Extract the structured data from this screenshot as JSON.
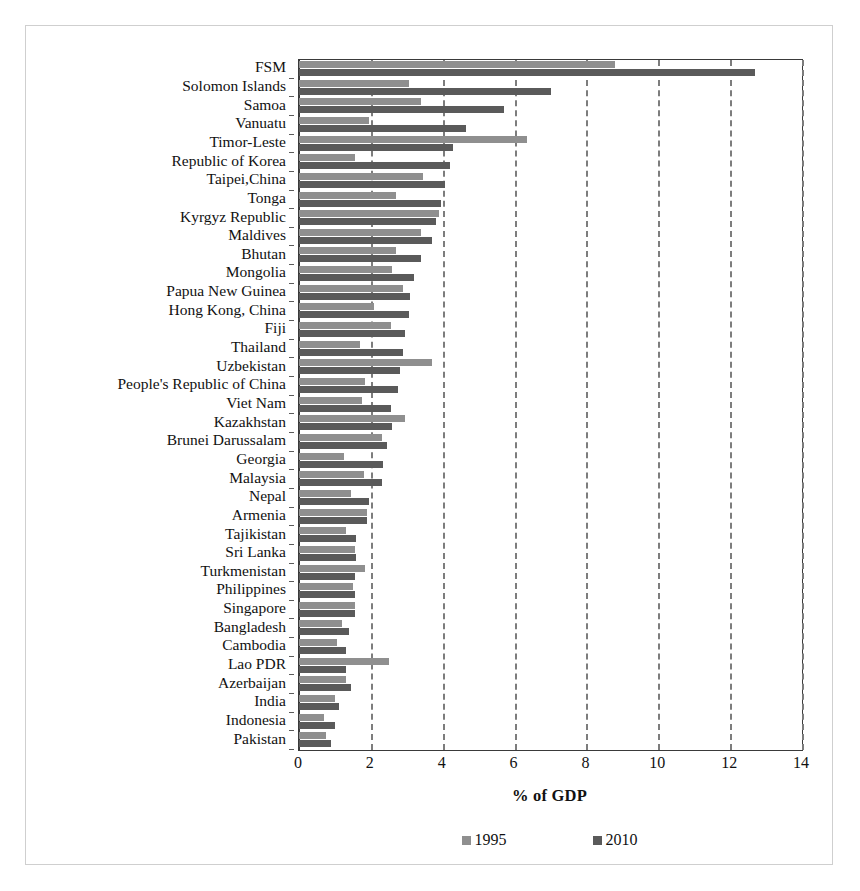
{
  "chart_data": {
    "type": "bar",
    "orientation": "horizontal",
    "title": "",
    "xlabel": "% of GDP",
    "ylabel": "",
    "xlim": [
      0,
      14
    ],
    "xticks": [
      0,
      2,
      4,
      6,
      8,
      10,
      12,
      14
    ],
    "grid": "vertical-dashed",
    "legend_position": "bottom-center",
    "categories": [
      "FSM",
      "Solomon Islands",
      "Samoa",
      "Vanuatu",
      "Timor-Leste",
      "Republic of Korea",
      "Taipei,China",
      "Tonga",
      "Kyrgyz Republic",
      "Maldives",
      "Bhutan",
      "Mongolia",
      "Papua New Guinea",
      "Hong Kong, China",
      "Fiji",
      "Thailand",
      "Uzbekistan",
      "People's Republic of China",
      "Viet Nam",
      "Kazakhstan",
      "Brunei Darussalam",
      "Georgia",
      "Malaysia",
      "Nepal",
      "Armenia",
      "Tajikistan",
      "Sri Lanka",
      "Turkmenistan",
      "Philippines",
      "Singapore",
      "Bangladesh",
      "Cambodia",
      "Lao PDR",
      "Azerbaijan",
      "India",
      "Indonesia",
      "Pakistan"
    ],
    "series": [
      {
        "name": "1995",
        "color": "#8f8f8f",
        "values": [
          8.8,
          3.05,
          3.4,
          1.95,
          6.35,
          1.55,
          3.45,
          2.7,
          3.9,
          3.4,
          2.7,
          2.6,
          2.9,
          2.1,
          2.55,
          1.7,
          3.7,
          1.85,
          1.75,
          2.95,
          2.3,
          1.25,
          1.8,
          1.45,
          1.9,
          1.3,
          1.55,
          1.85,
          1.5,
          1.55,
          1.2,
          1.05,
          2.5,
          1.3,
          1.0,
          0.7,
          0.75
        ]
      },
      {
        "name": "2010",
        "color": "#5a5a5a",
        "values": [
          12.7,
          7.0,
          5.7,
          4.65,
          4.3,
          4.2,
          4.05,
          3.95,
          3.8,
          3.7,
          3.4,
          3.2,
          3.1,
          3.05,
          2.95,
          2.9,
          2.8,
          2.75,
          2.55,
          2.6,
          2.45,
          2.35,
          2.3,
          1.95,
          1.9,
          1.6,
          1.6,
          1.55,
          1.55,
          1.55,
          1.4,
          1.3,
          1.3,
          1.45,
          1.1,
          1.0,
          0.9
        ]
      }
    ],
    "xtick_labels": [
      "0",
      "2",
      "4",
      "6",
      "8",
      "10",
      "12",
      "14"
    ],
    "legend": [
      {
        "label": "1995",
        "color": "#8f8f8f"
      },
      {
        "label": "2010",
        "color": "#5a5a5a"
      }
    ]
  }
}
